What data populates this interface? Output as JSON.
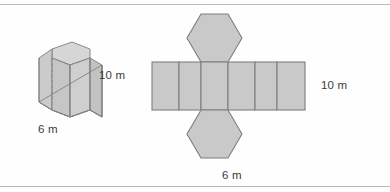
{
  "figure": {
    "colors": {
      "fill": "#c9c9c9",
      "fill_light": "#d4d4d4",
      "fill_dark": "#bdbdbd",
      "stroke": "#7f7f7f",
      "stroke_light": "#9a9a9a",
      "text": "#3b3b3b",
      "rule": "#b9b9b9",
      "background": "#fefefe"
    }
  },
  "prism": {
    "name": "hexagonal prism",
    "height_label": "10 m",
    "base_label": "6 m",
    "hidden_edge_style": "dashed"
  },
  "net": {
    "name": "net of hexagonal prism",
    "rectangle_count": 6,
    "hexagon_count": 2,
    "height_label": "10 m",
    "base_label": "6 m"
  },
  "measurements": {
    "height": 10,
    "base_edge": 6,
    "units": "m"
  }
}
